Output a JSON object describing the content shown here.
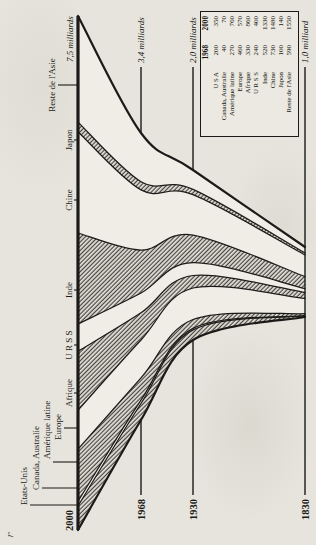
{
  "figure": {
    "background_color": "#e6e4dc",
    "ink_color": "#1b1a18",
    "band_fill_color": "#efede5",
    "hatch_color": "#45433e",
    "corner_mark": "r"
  },
  "chart_data": {
    "type": "area",
    "time_axis": [
      "1830",
      "1930",
      "1968",
      "2000"
    ],
    "unit": "millions of inhabitants",
    "years": [
      {
        "label": "2000",
        "total_label": "7,5 milliards",
        "y": 78,
        "band_left": 15,
        "band_right": 529,
        "line_start": 15,
        "line_end": 529,
        "axis": true
      },
      {
        "label": "1968",
        "total_label": "3,4 milliards",
        "y": 141,
        "band_left": 125,
        "band_right": 412,
        "line_start": 50,
        "line_end": 478,
        "axis": false
      },
      {
        "label": "1930",
        "total_label": "2,0 milliards",
        "y": 193,
        "band_left": 205,
        "band_right": 375,
        "line_start": 50,
        "line_end": 478,
        "axis": false
      },
      {
        "label": "1830",
        "total_label": "1,0 milliard",
        "y": 305,
        "band_left": 228,
        "band_right": 298,
        "line_start": 50,
        "line_end": 478,
        "axis": false
      }
    ],
    "regions": [
      {
        "key": "usa",
        "label": "Etats-Unis",
        "legend_label": "U S A",
        "hatched": true,
        "population": {
          "2000": 350,
          "1968": 200,
          "1930": 125,
          "1830": 15
        },
        "label_layout": {
          "baseline_y": 27,
          "leader_x": 40,
          "anchor": "start",
          "text_x": 40,
          "leader_top": 30
        }
      },
      {
        "key": "canada_australie",
        "label": "Canada, Australie",
        "legend_label": "Canada, Australie",
        "hatched": false,
        "population": {
          "2000": 70,
          "1968": 40,
          "1930": 18,
          "1830": 5
        },
        "label_layout": {
          "baseline_y": 39,
          "leader_x": 57,
          "anchor": "start",
          "text_x": 55,
          "leader_top": 42
        }
      },
      {
        "key": "amerique_latine",
        "label": "Amérique latine",
        "legend_label": "Amérique latine",
        "hatched": true,
        "population": {
          "2000": 760,
          "1968": 270,
          "1930": 110,
          "1830": 30
        },
        "label_layout": {
          "baseline_y": 50,
          "leader_x": 83,
          "anchor": "start",
          "text_x": 86,
          "leader_top": 53
        }
      },
      {
        "key": "europe",
        "label": "Europe",
        "legend_label": "Europe",
        "hatched": false,
        "population": {
          "2000": 570,
          "1968": 460,
          "1930": 390,
          "1830": 230
        },
        "label_layout": {
          "baseline_y": 61,
          "leader_x": 117,
          "anchor": "middle",
          "text_x": 118,
          "leader_top": 64
        }
      },
      {
        "key": "afrique",
        "label": "Afrique",
        "legend_label": "Afrique",
        "hatched": true,
        "population": {
          "2000": 860,
          "1968": 330,
          "1930": 155,
          "1830": 90
        },
        "label_layout": {
          "baseline_y": 72,
          "leader_x": 152,
          "anchor": "middle",
          "text_x": 152,
          "leader_top": 74
        }
      },
      {
        "key": "urss",
        "label": "U R S S",
        "legend_label": "U R S S",
        "hatched": false,
        "population": {
          "2000": 400,
          "1968": 240,
          "1930": 160,
          "1830": 60
        },
        "label_layout": {
          "baseline_y": 72,
          "leader_x": 200,
          "anchor": "middle",
          "text_x": 200,
          "leader_top": 74
        }
      },
      {
        "key": "inde",
        "label": "Inde",
        "legend_label": "Inde",
        "hatched": true,
        "population": {
          "2000": 1330,
          "1968": 520,
          "1930": 340,
          "1830": 180
        },
        "label_layout": {
          "baseline_y": 72,
          "leader_x": 255,
          "anchor": "middle",
          "text_x": 255,
          "leader_top": 74
        }
      },
      {
        "key": "chine",
        "label": "Chine",
        "legend_label": "Chine",
        "hatched": false,
        "population": {
          "2000": 1480,
          "1968": 730,
          "1930": 500,
          "1830": 330
        },
        "label_layout": {
          "baseline_y": 72,
          "leader_x": 345,
          "anchor": "middle",
          "text_x": 345,
          "leader_top": 74
        }
      },
      {
        "key": "japon",
        "label": "Japon",
        "legend_label": "Japon",
        "hatched": true,
        "population": {
          "2000": 140,
          "1968": 100,
          "1930": 65,
          "1830": 30
        },
        "label_layout": {
          "baseline_y": 72,
          "leader_x": 405,
          "anchor": "middle",
          "text_x": 405,
          "leader_top": 74
        }
      },
      {
        "key": "reste_asie",
        "label": "Reste de l'Asie",
        "legend_label": "Reste de l'Asie",
        "hatched": false,
        "population": {
          "2000": 1550,
          "1968": 590,
          "1930": 240,
          "1830": 90
        },
        "label_layout": {
          "baseline_y": 55,
          "leader_x": 460,
          "anchor": "middle",
          "text_x": 460,
          "leader_top": 58
        }
      }
    ],
    "legend": {
      "col_headers": [
        "1968",
        "2000"
      ],
      "position": "between 1930 and 1830 lines, right side"
    }
  }
}
